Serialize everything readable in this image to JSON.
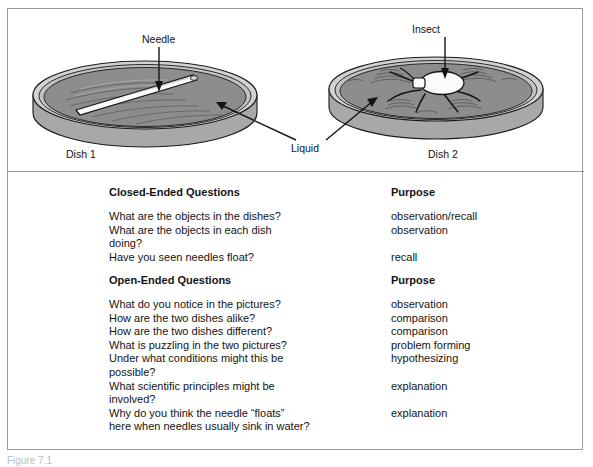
{
  "figure": {
    "labels": {
      "needle": "Needle",
      "insect": "Insect",
      "liquid": "Liquid",
      "dish1": "Dish 1",
      "dish2": "Dish 2"
    },
    "colors": {
      "liquid_fill": "#8d8d8d",
      "dish_rim": "#c9c9c9",
      "dish_wall": "#a8a8a8",
      "outline": "#1a1a1a",
      "frame_border": "#9a9a9a"
    }
  },
  "table": {
    "sections": [
      {
        "heading_question": "Closed-Ended Questions",
        "heading_purpose": "Purpose",
        "rows": [
          {
            "question": "What are the objects in the dishes?",
            "purpose": "observation/recall"
          },
          {
            "question": "What are the objects in each dish",
            "purpose": "observation"
          },
          {
            "question": "doing?",
            "purpose": ""
          },
          {
            "question": "Have you seen needles float?",
            "purpose": "recall"
          }
        ]
      },
      {
        "heading_question": "Open-Ended Questions",
        "heading_purpose": "Purpose",
        "rows": [
          {
            "question": "What do you notice in the pictures?",
            "purpose": "observation"
          },
          {
            "question": "How are the two dishes alike?",
            "purpose": "comparison"
          },
          {
            "question": "How are the two dishes different?",
            "purpose": "comparison"
          },
          {
            "question": "What is puzzling in the two pictures?",
            "purpose": "problem forming"
          },
          {
            "question": "Under what conditions might this be",
            "purpose": "hypothesizing"
          },
          {
            "question": "possible?",
            "purpose": ""
          },
          {
            "question": "What scientific principles might be",
            "purpose": "explanation"
          },
          {
            "question": "involved?",
            "purpose": ""
          },
          {
            "question": "Why do you think the needle “floats”",
            "purpose": "explanation"
          },
          {
            "question": "here when needles usually sink in water?",
            "purpose": ""
          }
        ]
      }
    ]
  },
  "caption": {
    "text": "Figure 7.1"
  }
}
